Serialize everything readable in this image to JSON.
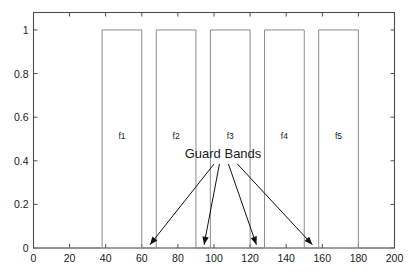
{
  "chart_data": {
    "type": "line",
    "title": "",
    "subtitle": "",
    "xlabel": "",
    "ylabel": "",
    "xlim": [
      0,
      200
    ],
    "ylim": [
      0,
      1.08
    ],
    "grid": false,
    "legend": null,
    "x_ticks": [
      0,
      20,
      40,
      60,
      80,
      100,
      120,
      140,
      160,
      180,
      200
    ],
    "x_tick_labels": [
      "0",
      "20",
      "40",
      "60",
      "80",
      "100",
      "120",
      "140",
      "160",
      "180",
      "200"
    ],
    "y_ticks": [
      0,
      0.2,
      0.4,
      0.6,
      0.8,
      1
    ],
    "y_tick_labels": [
      "0",
      "0.2",
      "0.4",
      "0.6",
      "0.8",
      "1"
    ],
    "series": [
      {
        "name": "channel-spectrum",
        "description": "Idealised rectangular channel passbands separated by guard bands",
        "x": [
          0,
          38,
          38,
          60,
          60,
          68,
          68,
          90,
          90,
          98,
          98,
          120,
          120,
          128,
          128,
          150,
          150,
          158,
          158,
          180,
          180,
          200
        ],
        "values": [
          0,
          0,
          1,
          1,
          0,
          0,
          1,
          1,
          0,
          0,
          1,
          1,
          0,
          0,
          1,
          1,
          0,
          0,
          1,
          1,
          0,
          0
        ]
      }
    ],
    "pulses": [
      {
        "label": "f1",
        "x_start": 38,
        "x_end": 60,
        "height": 1,
        "label_x": 49,
        "label_y": 0.5
      },
      {
        "label": "f2",
        "x_start": 68,
        "x_end": 90,
        "height": 1,
        "label_x": 79,
        "label_y": 0.5
      },
      {
        "label": "f3",
        "x_start": 98,
        "x_end": 120,
        "height": 1,
        "label_x": 109,
        "label_y": 0.5
      },
      {
        "label": "f4",
        "x_start": 128,
        "x_end": 150,
        "height": 1,
        "label_x": 139,
        "label_y": 0.5
      },
      {
        "label": "f5",
        "x_start": 158,
        "x_end": 180,
        "height": 1,
        "label_x": 169,
        "label_y": 0.5
      }
    ],
    "guard_bands": [
      {
        "x_start": 60,
        "x_end": 68,
        "arrow_tip_x": 64.5,
        "arrow_tip_y": 0.015
      },
      {
        "x_start": 90,
        "x_end": 98,
        "arrow_tip_x": 94.5,
        "arrow_tip_y": 0.015
      },
      {
        "x_start": 120,
        "x_end": 128,
        "arrow_tip_x": 123.5,
        "arrow_tip_y": 0.015
      },
      {
        "x_start": 150,
        "x_end": 158,
        "arrow_tip_x": 154.5,
        "arrow_tip_y": 0.015
      }
    ],
    "annotations": [
      {
        "text": "Guard Bands",
        "x": 105,
        "y": 0.415,
        "anchor_x": 100,
        "anchor_y": 0.4,
        "arrow_origins": [
          {
            "x": 100,
            "y": 0.385
          },
          {
            "x": 103,
            "y": 0.385
          },
          {
            "x": 108,
            "y": 0.385
          },
          {
            "x": 113,
            "y": 0.385
          }
        ]
      }
    ],
    "colors": {
      "signal": "#8c8c8c",
      "axis": "#4d4d4d",
      "text": "#1a1a1a",
      "arrow": "#111111",
      "background": "#ffffff"
    }
  },
  "figure": {
    "name": "guard-band-spectrum-plot",
    "annotation_text": "Guard Bands",
    "band_labels": [
      "f1",
      "f2",
      "f3",
      "f4",
      "f5"
    ]
  }
}
